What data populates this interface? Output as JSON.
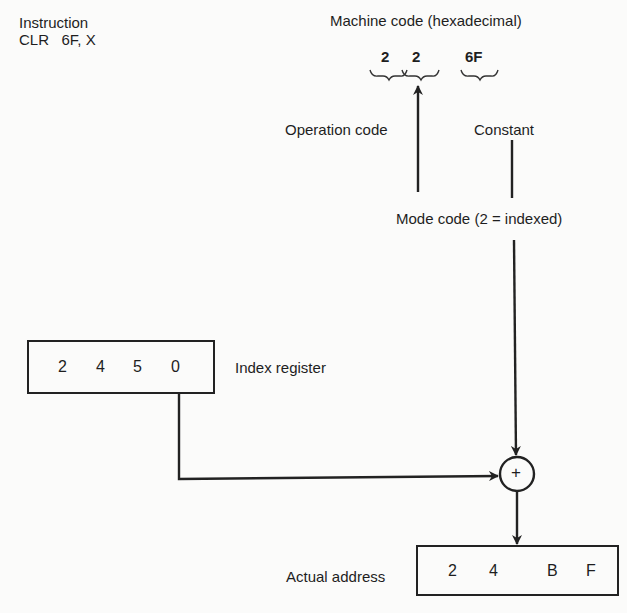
{
  "instruction": {
    "label": "Instruction",
    "text": "CLR   6F, X"
  },
  "machine_code": {
    "title": "Machine code (hexadecimal)",
    "digits": [
      "2",
      "2",
      "6F"
    ]
  },
  "labels": {
    "operation_code": "Operation code",
    "constant": "Constant",
    "mode_code": "Mode code (2 = indexed)",
    "index_register": "Index register",
    "actual_address": "Actual address"
  },
  "index_register": {
    "digits": [
      "2",
      "4",
      "5",
      "0"
    ]
  },
  "adder": {
    "symbol": "+"
  },
  "actual_address": {
    "digits": [
      "2",
      "4",
      "B",
      "F"
    ]
  }
}
